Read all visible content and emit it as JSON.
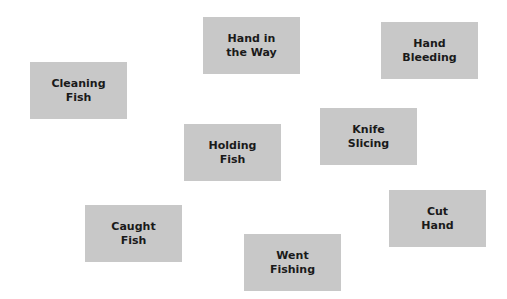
{
  "cards": [
    {
      "line1": "Hand in",
      "line2": "the Way"
    },
    {
      "line1": "Hand",
      "line2": "Bleeding"
    },
    {
      "line1": "Cleaning",
      "line2": "Fish"
    },
    {
      "line1": "Knife",
      "line2": "Slicing"
    },
    {
      "line1": "Holding",
      "line2": "Fish"
    },
    {
      "line1": "Cut",
      "line2": "Hand"
    },
    {
      "line1": "Caught",
      "line2": "Fish"
    },
    {
      "line1": "Went",
      "line2": "Fishing"
    }
  ],
  "colors": {
    "card_bg": "#c8c8c8",
    "text": "#1a1a1a",
    "background": "#ffffff"
  }
}
